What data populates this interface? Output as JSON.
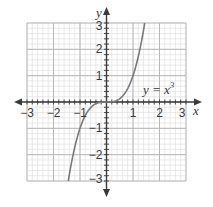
{
  "chart_data": {
    "type": "line",
    "title": "",
    "xlabel": "x",
    "ylabel": "y",
    "xlim": [
      -3,
      3
    ],
    "ylim": [
      -3,
      3
    ],
    "grid": true,
    "grid_major_step": 1,
    "grid_minor_step": 0.2,
    "x_ticks": [
      -3,
      -2,
      -1,
      1,
      2,
      3
    ],
    "y_ticks": [
      -3,
      -2,
      -1,
      1,
      2,
      3
    ],
    "x_tick_labels": [
      "−3",
      "−2",
      "−1",
      "1",
      "2",
      "3"
    ],
    "y_tick_labels": [
      "−3",
      "−2",
      "−1",
      "1",
      "2",
      "3"
    ],
    "series": [
      {
        "name": "y = x³",
        "function": "x^3",
        "x": [
          -1.44,
          -1.2,
          -1.0,
          -0.8,
          -0.6,
          -0.4,
          -0.2,
          0,
          0.2,
          0.4,
          0.6,
          0.8,
          1.0,
          1.2,
          1.44
        ],
        "values": [
          -2.99,
          -1.728,
          -1.0,
          -0.512,
          -0.216,
          -0.064,
          -0.008,
          0,
          0.008,
          0.064,
          0.216,
          0.512,
          1.0,
          1.728,
          2.99
        ],
        "color": "#7a7a7a"
      }
    ],
    "annotations": [
      {
        "text": "y = x",
        "superscript": "3",
        "x": 1.05,
        "y": 0.4
      }
    ],
    "legend": null
  },
  "labels": {
    "x_axis": "x",
    "y_axis": "y",
    "equation_main": "y = x",
    "equation_sup": "3"
  },
  "colors": {
    "minor_grid": "#dcdcdc",
    "major_grid": "#b8b8b8",
    "axis": "#3a3a3a",
    "curve": "#7a7a7a",
    "text": "#3a3a3a"
  }
}
